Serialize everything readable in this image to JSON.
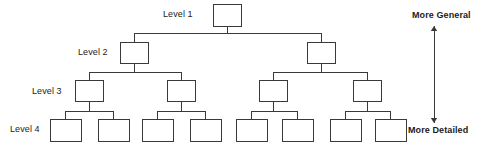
{
  "diagram": {
    "type": "hierarchy-tree",
    "background_color": "#ffffff",
    "line_color": "#3a3a3a",
    "box_fill": "#ffffff",
    "text_color": "#1b1b1b",
    "level_labels": [
      {
        "id": "level-1",
        "text": "Level 1",
        "x": 163,
        "y": 9
      },
      {
        "id": "level-2",
        "text": "Level 2",
        "x": 78,
        "y": 47
      },
      {
        "id": "level-3",
        "text": "Level 3",
        "x": 32,
        "y": 86
      },
      {
        "id": "level-4",
        "text": "Level 4",
        "x": 10,
        "y": 124
      }
    ],
    "axis": {
      "top_label": "More General",
      "bottom_label": "More Detailed",
      "top_label_x": 412,
      "top_label_y": 10,
      "bottom_label_x": 408,
      "bottom_label_y": 125,
      "arrow_x": 434,
      "arrow_top_y": 26,
      "arrow_bottom_y": 123,
      "double_headed": true
    },
    "nodes": [
      {
        "id": "n1",
        "level": 1,
        "x": 213,
        "y": 4,
        "w": 28,
        "h": 22
      },
      {
        "id": "n2a",
        "level": 2,
        "x": 120,
        "y": 42,
        "w": 28,
        "h": 21
      },
      {
        "id": "n2b",
        "level": 2,
        "x": 307,
        "y": 42,
        "w": 28,
        "h": 21
      },
      {
        "id": "n3a",
        "level": 3,
        "x": 75,
        "y": 80,
        "w": 28,
        "h": 21
      },
      {
        "id": "n3b",
        "level": 3,
        "x": 167,
        "y": 80,
        "w": 28,
        "h": 21
      },
      {
        "id": "n3c",
        "level": 3,
        "x": 259,
        "y": 80,
        "w": 28,
        "h": 21
      },
      {
        "id": "n3d",
        "level": 3,
        "x": 353,
        "y": 80,
        "w": 28,
        "h": 21
      },
      {
        "id": "n4a",
        "level": 4,
        "x": 50,
        "y": 119,
        "w": 31,
        "h": 22
      },
      {
        "id": "n4b",
        "level": 4,
        "x": 98,
        "y": 119,
        "w": 31,
        "h": 22
      },
      {
        "id": "n4c",
        "level": 4,
        "x": 142,
        "y": 119,
        "w": 31,
        "h": 22
      },
      {
        "id": "n4d",
        "level": 4,
        "x": 190,
        "y": 119,
        "w": 31,
        "h": 22
      },
      {
        "id": "n4e",
        "level": 4,
        "x": 236,
        "y": 119,
        "w": 31,
        "h": 22
      },
      {
        "id": "n4f",
        "level": 4,
        "x": 282,
        "y": 119,
        "w": 31,
        "h": 22
      },
      {
        "id": "n4g",
        "level": 4,
        "x": 330,
        "y": 119,
        "w": 31,
        "h": 22
      },
      {
        "id": "n4h",
        "level": 4,
        "x": 375,
        "y": 119,
        "w": 31,
        "h": 22
      }
    ],
    "connectors": [
      {
        "parent": "n1",
        "bus_y": 33,
        "children": [
          "n2a",
          "n2b"
        ]
      },
      {
        "parent": "n2a",
        "bus_y": 72,
        "children": [
          "n3a",
          "n3b"
        ]
      },
      {
        "parent": "n2b",
        "bus_y": 72,
        "children": [
          "n3c",
          "n3d"
        ]
      },
      {
        "parent": "n3a",
        "bus_y": 111,
        "children": [
          "n4a",
          "n4b"
        ]
      },
      {
        "parent": "n3b",
        "bus_y": 111,
        "children": [
          "n4c",
          "n4d"
        ]
      },
      {
        "parent": "n3c",
        "bus_y": 111,
        "children": [
          "n4e",
          "n4f"
        ]
      },
      {
        "parent": "n3d",
        "bus_y": 111,
        "children": [
          "n4g",
          "n4h"
        ]
      }
    ]
  }
}
